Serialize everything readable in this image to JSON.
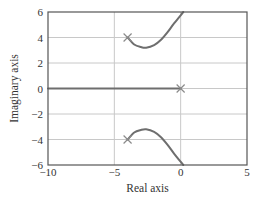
{
  "chart_data": {
    "type": "line",
    "title": "",
    "xlabel": "Real axis",
    "ylabel": "Imaginary axis",
    "xlim": [
      -10,
      5
    ],
    "ylim": [
      -6,
      6
    ],
    "grid": true,
    "legend": null,
    "x_ticks": [
      -10,
      -5,
      0,
      5
    ],
    "x_tick_labels": [
      "−10",
      "−5",
      "0",
      "5"
    ],
    "y_ticks": [
      6,
      4,
      2,
      0,
      -2,
      -4,
      -6
    ],
    "y_tick_labels": [
      "6",
      "4",
      "2",
      "0",
      "−2",
      "−4",
      "−6"
    ],
    "poles": [
      {
        "x": -4,
        "y": 4
      },
      {
        "x": -4,
        "y": -4
      },
      {
        "x": 0,
        "y": 0
      }
    ],
    "series": [
      {
        "name": "real-axis-branch",
        "points": [
          [
            -10,
            0
          ],
          [
            0,
            0
          ]
        ]
      },
      {
        "name": "upper-branch",
        "points": [
          [
            -4,
            4
          ],
          [
            -3.5,
            3.45
          ],
          [
            -3,
            3.25
          ],
          [
            -2.6,
            3.2
          ],
          [
            -2,
            3.4
          ],
          [
            -1.5,
            3.8
          ],
          [
            -1,
            4.4
          ],
          [
            -0.5,
            5.1
          ],
          [
            0.2,
            6
          ]
        ]
      },
      {
        "name": "lower-branch",
        "points": [
          [
            -4,
            -4
          ],
          [
            -3.5,
            -3.45
          ],
          [
            -3,
            -3.25
          ],
          [
            -2.6,
            -3.2
          ],
          [
            -2,
            -3.4
          ],
          [
            -1.5,
            -3.8
          ],
          [
            -1,
            -4.4
          ],
          [
            -0.5,
            -5.1
          ],
          [
            0.2,
            -6
          ]
        ]
      }
    ],
    "colors": {
      "locus": "#6e6e6e",
      "grid": "#c8c8c8",
      "frame": "#555555",
      "pole": "#8a8a8a",
      "text": "#333333"
    }
  },
  "layout": {
    "plot": {
      "left": 48,
      "right": 247,
      "top": 12,
      "bottom": 165
    }
  }
}
